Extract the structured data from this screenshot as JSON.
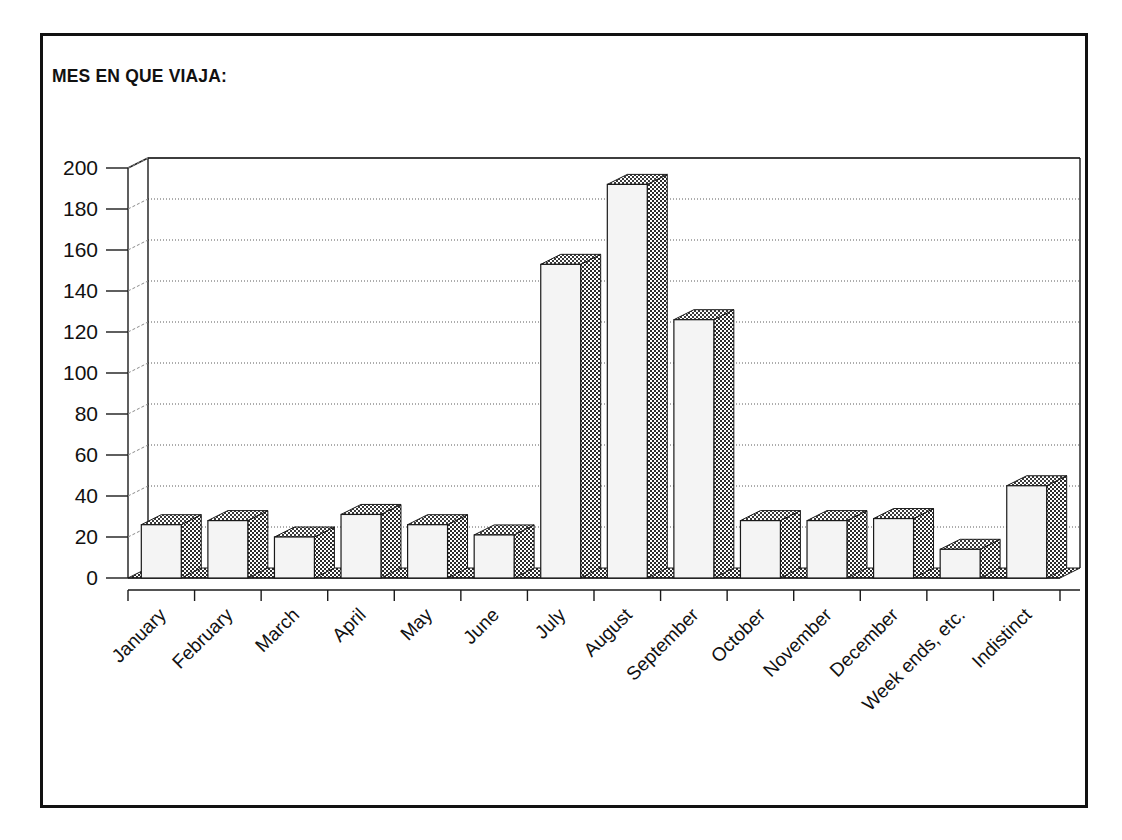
{
  "figure": {
    "title": "MES EN QUE VIAJA:",
    "border_color": "#111111",
    "background": "#ffffff"
  },
  "chart_data": {
    "type": "bar",
    "title": "MES EN QUE VIAJA:",
    "xlabel": "",
    "ylabel": "",
    "ylim": [
      0,
      200
    ],
    "ytick_step": 20,
    "yticks": [
      0,
      20,
      40,
      60,
      80,
      100,
      120,
      140,
      160,
      180,
      200
    ],
    "grid": true,
    "legend": false,
    "style": "3d-column",
    "bar_face_color": "#f4f4f4",
    "bar_side_color": "#5a5a5a",
    "categories": [
      "January",
      "February",
      "March",
      "April",
      "May",
      "June",
      "July",
      "August",
      "September",
      "October",
      "November",
      "December",
      "Week ends, etc.",
      "Indistinct"
    ],
    "values": [
      26,
      28,
      20,
      31,
      26,
      21,
      153,
      192,
      126,
      28,
      28,
      29,
      14,
      45
    ]
  }
}
